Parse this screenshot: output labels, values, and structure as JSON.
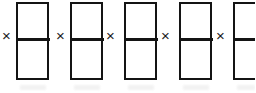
{
  "figure": {
    "type": "bar-model-multiplication-strip",
    "background_color": "#ffffff",
    "ink_color": "#141414",
    "canvas": {
      "width": 255,
      "height": 93
    },
    "operator_symbol": "×",
    "repeat_count": 5,
    "units": [
      {
        "index": 1,
        "operator": "×",
        "operator_x": 2,
        "operator_y": 28,
        "rect": {
          "x": 16,
          "y": 2,
          "width": 33,
          "height": 78
        },
        "divider_offset_y": 34,
        "segments": 2,
        "clipped": false
      },
      {
        "index": 2,
        "operator": "×",
        "operator_x": 56,
        "operator_y": 28,
        "rect": {
          "x": 70,
          "y": 2,
          "width": 33,
          "height": 78
        },
        "divider_offset_y": 34,
        "segments": 2,
        "clipped": false
      },
      {
        "index": 3,
        "operator": "×",
        "operator_x": 106,
        "operator_y": 28,
        "rect": {
          "x": 124,
          "y": 2,
          "width": 33,
          "height": 78
        },
        "divider_offset_y": 34,
        "segments": 2,
        "clipped": false
      },
      {
        "index": 4,
        "operator": "×",
        "operator_x": 161,
        "operator_y": 28,
        "rect": {
          "x": 179,
          "y": 2,
          "width": 33,
          "height": 78
        },
        "divider_offset_y": 34,
        "segments": 2,
        "clipped": false
      },
      {
        "index": 5,
        "operator": "×",
        "operator_x": 216,
        "operator_y": 28,
        "rect": {
          "x": 233,
          "y": 2,
          "width": 33,
          "height": 78
        },
        "divider_offset_y": 34,
        "segments": 2,
        "clipped": true
      }
    ],
    "smudges": [
      {
        "x": 20,
        "y": 85,
        "width": 26
      },
      {
        "x": 74,
        "y": 85,
        "width": 26
      },
      {
        "x": 128,
        "y": 85,
        "width": 26
      },
      {
        "x": 183,
        "y": 85,
        "width": 26
      },
      {
        "x": 237,
        "y": 85,
        "width": 18
      }
    ]
  }
}
